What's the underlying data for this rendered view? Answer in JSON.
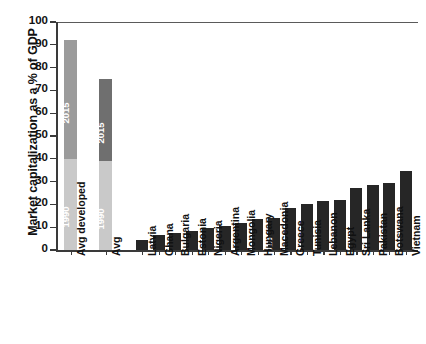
{
  "chart_data": {
    "type": "bar",
    "title": "",
    "xlabel": "",
    "ylabel": "Market capitalization as a % of GDP",
    "ylim": [
      0,
      100
    ],
    "ytick_labels": [
      "100",
      "90",
      "80",
      "70",
      "60",
      "50",
      "40",
      "30",
      "20",
      "10",
      "0"
    ],
    "ytick_values": [
      100,
      90,
      80,
      70,
      60,
      50,
      40,
      30,
      20,
      10,
      0
    ],
    "grid": false,
    "legend": "none",
    "stacked_note": "First two bars are stacked: lower light segment labelled 1990, upper segment labelled 2015",
    "categories": [
      "Avg developed",
      "Avg",
      "Latvia",
      "Ghana",
      "Bulgaria",
      "Estonia",
      "Nigeria",
      "Argentina",
      "Mongolia",
      "Hungary",
      "Macedonia",
      "Greece",
      "Tunisia",
      "Lebanon",
      "Egypt",
      "Sri Lanka",
      "Pakistan",
      "Botswana",
      "Vietnam"
    ],
    "values": [
      92,
      75,
      4.5,
      6.7,
      7.5,
      8.5,
      9.5,
      10.5,
      12,
      13.5,
      14,
      18.5,
      20,
      21.5,
      22,
      27,
      28.5,
      29.5,
      34.5
    ],
    "bars": [
      {
        "label": "Avg developed",
        "value": 92,
        "segments": [
          {
            "name": "1990",
            "from": 0,
            "to": 40,
            "color": "#c9c9c9",
            "inner_label": "1990"
          },
          {
            "name": "2015",
            "from": 40,
            "to": 92,
            "color": "#9b9b9b",
            "inner_label": "2015"
          }
        ]
      },
      {
        "label": "Avg",
        "value": 75,
        "segments": [
          {
            "name": "1990",
            "from": 0,
            "to": 39,
            "color": "#c9c9c9",
            "inner_label": "1990"
          },
          {
            "name": "2015",
            "from": 39,
            "to": 75,
            "color": "#6f6f6f",
            "inner_label": "2015"
          }
        ]
      },
      {
        "label": "Latvia",
        "value": 4.5,
        "segments": [
          {
            "name": "2015",
            "from": 0,
            "to": 4.5,
            "color": "#262626",
            "inner_label": ""
          }
        ]
      },
      {
        "label": "Ghana",
        "value": 6.7,
        "segments": [
          {
            "name": "2015",
            "from": 0,
            "to": 6.7,
            "color": "#262626",
            "inner_label": ""
          }
        ]
      },
      {
        "label": "Bulgaria",
        "value": 7.5,
        "segments": [
          {
            "name": "2015",
            "from": 0,
            "to": 7.5,
            "color": "#262626",
            "inner_label": ""
          }
        ]
      },
      {
        "label": "Estonia",
        "value": 8.5,
        "segments": [
          {
            "name": "2015",
            "from": 0,
            "to": 8.5,
            "color": "#262626",
            "inner_label": ""
          }
        ]
      },
      {
        "label": "Nigeria",
        "value": 9.5,
        "segments": [
          {
            "name": "2015",
            "from": 0,
            "to": 9.5,
            "color": "#262626",
            "inner_label": ""
          }
        ]
      },
      {
        "label": "Argentina",
        "value": 10.5,
        "segments": [
          {
            "name": "2015",
            "from": 0,
            "to": 10.5,
            "color": "#262626",
            "inner_label": ""
          }
        ]
      },
      {
        "label": "Mongolia",
        "value": 12,
        "segments": [
          {
            "name": "2015",
            "from": 0,
            "to": 12,
            "color": "#262626",
            "inner_label": ""
          }
        ]
      },
      {
        "label": "Hungary",
        "value": 13.5,
        "segments": [
          {
            "name": "2015",
            "from": 0,
            "to": 13.5,
            "color": "#262626",
            "inner_label": ""
          }
        ]
      },
      {
        "label": "Macedonia",
        "value": 14,
        "segments": [
          {
            "name": "2015",
            "from": 0,
            "to": 14,
            "color": "#262626",
            "inner_label": "2015"
          }
        ]
      },
      {
        "label": "Greece",
        "value": 18.5,
        "segments": [
          {
            "name": "2015",
            "from": 0,
            "to": 18.5,
            "color": "#262626",
            "inner_label": ""
          }
        ]
      },
      {
        "label": "Tunisia",
        "value": 20,
        "segments": [
          {
            "name": "2015",
            "from": 0,
            "to": 20,
            "color": "#262626",
            "inner_label": ""
          }
        ]
      },
      {
        "label": "Lebanon",
        "value": 21.5,
        "segments": [
          {
            "name": "2015",
            "from": 0,
            "to": 21.5,
            "color": "#262626",
            "inner_label": ""
          }
        ]
      },
      {
        "label": "Egypt",
        "value": 22,
        "segments": [
          {
            "name": "2015",
            "from": 0,
            "to": 22,
            "color": "#262626",
            "inner_label": ""
          }
        ]
      },
      {
        "label": "Sri Lanka",
        "value": 27,
        "segments": [
          {
            "name": "2015",
            "from": 0,
            "to": 27,
            "color": "#262626",
            "inner_label": ""
          }
        ]
      },
      {
        "label": "Pakistan",
        "value": 28.5,
        "segments": [
          {
            "name": "2015",
            "from": 0,
            "to": 28.5,
            "color": "#262626",
            "inner_label": ""
          }
        ]
      },
      {
        "label": "Botswana",
        "value": 29.5,
        "segments": [
          {
            "name": "2015",
            "from": 0,
            "to": 29.5,
            "color": "#262626",
            "inner_label": ""
          }
        ]
      },
      {
        "label": "Vietnam",
        "value": 34.5,
        "segments": [
          {
            "name": "2015",
            "from": 0,
            "to": 34.5,
            "color": "#262626",
            "inner_label": ""
          }
        ]
      }
    ],
    "colors": {
      "segment_1990": "#c9c9c9",
      "segment_2015_developed": "#9b9b9b",
      "segment_2015_avg": "#6f6f6f",
      "bar_country": "#262626",
      "axis": "#3a3a3a",
      "text": "#111111"
    }
  }
}
